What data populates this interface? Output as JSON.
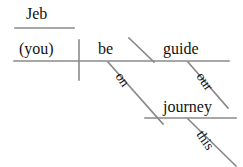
{
  "diagram": {
    "type": "reed-kellogg-sentence-diagram",
    "sentence": "Jeb, be our guide on this journey.",
    "colors": {
      "line": "#8a8a8a",
      "text": "#111111",
      "background": "#ffffff"
    },
    "labels": {
      "vocative": "Jeb",
      "subject": "(you)",
      "verb": "be",
      "complement": "guide",
      "preposition": "on",
      "object_of_preposition": "journey",
      "modifier_guide": "our",
      "modifier_journey": "this"
    },
    "lines": {
      "vocative_baseline": "horizontal line under Jeb",
      "main_baseline": "main horizontal baseline",
      "subject_verb_divider": "vertical bar crossing baseline",
      "complement_slant": "backslash between verb and complement",
      "preposition_slant": "slant from baseline down to prepositional phrase",
      "prep_object_baseline": "horizontal line under journey",
      "modifier_our_slant": "slant under guide",
      "modifier_this_slant": "slant under journey"
    }
  }
}
